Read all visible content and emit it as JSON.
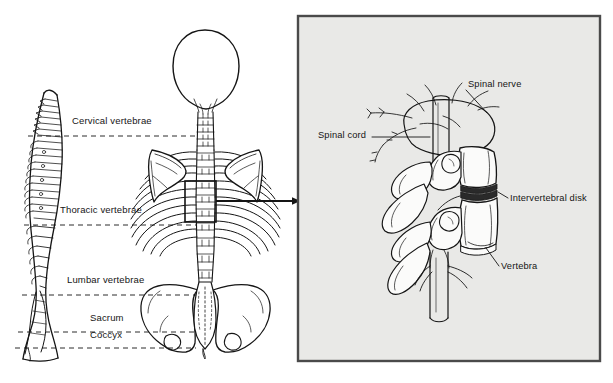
{
  "figure": {
    "background_color": "#ffffff",
    "ink_color": "#151515",
    "panel_fill": "#e9e9e7",
    "panel_border": "#4a4a4a",
    "disk_color": "#2a2a2a"
  },
  "left_panel": {
    "name": "spinal-column-overview",
    "views": [
      {
        "name": "lateral-spine-view",
        "description": "Side view of vertebral column showing S-curve"
      },
      {
        "name": "posterior-skeleton-view",
        "description": "Rear view of skull, cervical spine, ribcage, scapulae, lumbar spine and pelvis"
      }
    ],
    "region_labels": [
      {
        "id": "cervical",
        "label": "Cervical vertebrae",
        "x": 72,
        "y": 122,
        "line_y": 136
      },
      {
        "id": "thoracic",
        "label": "Thoracic vertebrae",
        "x": 60,
        "y": 211,
        "line_y": 225
      },
      {
        "id": "lumbar",
        "label": "Lumbar vertebrae",
        "x": 67,
        "y": 281,
        "line_y": 295
      },
      {
        "id": "sacrum",
        "label": "Sacrum",
        "x": 90,
        "y": 318,
        "line_y": 332
      },
      {
        "id": "coccyx",
        "label": "Coccyx",
        "x": 90,
        "y": 334,
        "line_y": 348
      }
    ],
    "callout_box": {
      "x": 185,
      "y": 181,
      "width": 31,
      "height": 41
    },
    "callout_arrow": {
      "from_x": 216,
      "to_x": 302,
      "y": 201
    }
  },
  "right_panel": {
    "name": "vertebra-detail-panel",
    "x": 297,
    "y": 15,
    "width": 304,
    "height": 347,
    "labels": [
      {
        "id": "spinal-nerve",
        "label": "Spinal nerve",
        "x": 468,
        "y": 85,
        "align": "left"
      },
      {
        "id": "spinal-cord",
        "label": "Spinal cord",
        "x": 318,
        "y": 135,
        "align": "left"
      },
      {
        "id": "intervertebral-disk",
        "label": "Intervertebral disk",
        "x": 509,
        "y": 199,
        "align": "left"
      },
      {
        "id": "vertebra",
        "label": "Vertebra",
        "x": 500,
        "y": 267,
        "align": "left"
      }
    ],
    "structures": [
      "nerve-plexus",
      "spinal-cord-cylinder",
      "upper-vertebral-body",
      "lower-vertebral-body",
      "intervertebral-disk",
      "transverse-process",
      "spinous-process",
      "articular-facet"
    ]
  }
}
